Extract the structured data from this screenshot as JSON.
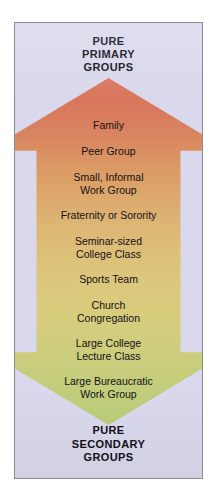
{
  "figure": {
    "title_top": "PURE\nPRIMARY\nGROUPS",
    "title_bottom": "PURE\nSECONDARY\nGROUPS",
    "panel_background": "#d9d8ec",
    "border_color": "#8a8a96",
    "arrow": {
      "direction": "down",
      "gradient_top_color": "#d8755c",
      "gradient_middle_color": "#ddbf78",
      "gradient_bottom_color": "#bccd7b"
    },
    "items": [
      {
        "label": "Family",
        "lines": 1
      },
      {
        "label": "Peer Group",
        "lines": 1
      },
      {
        "label": "Small, Informal\nWork Group",
        "lines": 2
      },
      {
        "label": "Fraternity or Sorority",
        "lines": 1
      },
      {
        "label": "Seminar-sized\nCollege Class",
        "lines": 2
      },
      {
        "label": "Sports Team",
        "lines": 1
      },
      {
        "label": "Church\nCongregation",
        "lines": 2
      },
      {
        "label": "Large College\nLecture Class",
        "lines": 2
      },
      {
        "label": "Large Bureaucratic\nWork Group",
        "lines": 2
      }
    ]
  }
}
